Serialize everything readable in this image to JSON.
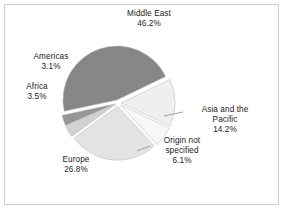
{
  "chart_data": {
    "type": "pie",
    "title": "",
    "subtitle": "",
    "xlabel": "",
    "ylabel": "",
    "legend_position": "none",
    "grid": false,
    "labels_outside": true,
    "exploded": true,
    "categories": [
      "Middle East",
      "Asia and the Pacific",
      "Origin not specified",
      "Europe",
      "Africa",
      "Americas"
    ],
    "values": [
      46.2,
      14.2,
      6.1,
      26.8,
      3.5,
      3.1
    ],
    "value_suffix": "%",
    "slices": [
      {
        "name": "Middle East",
        "label_line1": "Middle East",
        "value_text": "46.2%",
        "value": 46.2,
        "color": "#878787",
        "start_angle": 258.0,
        "end_angle": 424.3
      },
      {
        "name": "Asia and the Pacific",
        "label_line1": "Asia and the",
        "label_line2": "Pacific",
        "value_text": "14.2%",
        "value": 14.2,
        "color": "#efefef",
        "start_angle": 64.3,
        "end_angle": 115.4
      },
      {
        "name": "Origin not specified",
        "label_line1": "Origin not",
        "label_line2": "specified",
        "value_text": "6.1%",
        "value": 6.1,
        "color": "#f7f7f7",
        "start_angle": 115.4,
        "end_angle": 137.4
      },
      {
        "name": "Europe",
        "label_line1": "Europe",
        "value_text": "26.8%",
        "value": 26.8,
        "color": "#e3e3e3",
        "start_angle": 137.4,
        "end_angle": 233.8
      },
      {
        "name": "Africa",
        "label_line1": "Africa",
        "value_text": "3.5%",
        "value": 3.5,
        "color": "#d2d2d2",
        "start_angle": 233.8,
        "end_angle": 246.4
      },
      {
        "name": "Americas",
        "label_line1": "Americas",
        "value_text": "3.1%",
        "value": 3.1,
        "color": "#969696",
        "start_angle": 246.4,
        "end_angle": 258.0
      }
    ]
  },
  "labels": {
    "middle_east": {
      "name": "Middle East",
      "value": "46.2%"
    },
    "americas": {
      "name": "Americas",
      "value": "3.1%"
    },
    "africa": {
      "name": "Africa",
      "value": "3.5%"
    },
    "asia": {
      "name_line1": "Asia and the",
      "name_line2": "Pacific",
      "value": "14.2%"
    },
    "origin": {
      "name_line1": "Origin not",
      "name_line2": "specified",
      "value": "6.1%"
    },
    "europe": {
      "name": "Europe",
      "value": "26.8%"
    }
  },
  "colors": {
    "background": "#ffffff",
    "frame_border": "#cfcfcf",
    "text": "#222222",
    "slice_gap": "#ffffff",
    "leader_line": "#8a8a8a"
  }
}
